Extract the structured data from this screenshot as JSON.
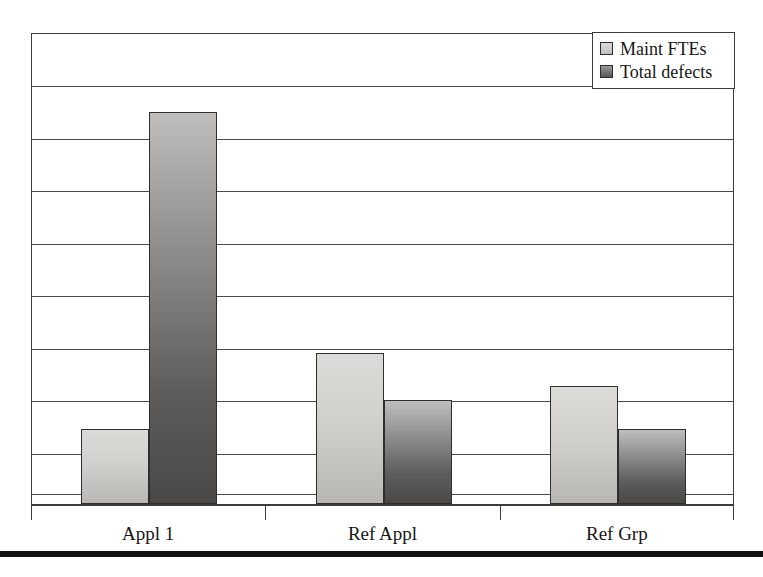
{
  "chart_data": {
    "type": "bar",
    "title": "",
    "subtitle": "",
    "xlabel": "",
    "ylabel": "",
    "categories": [
      "Appl 1",
      "Ref Appl",
      "Ref Grp"
    ],
    "series": [
      {
        "name": "Maint FTEs",
        "values": [
          1.6,
          3.2,
          2.5
        ],
        "color": "#d2d0cd"
      },
      {
        "name": "Total defects",
        "values": [
          8.3,
          2.2,
          1.6
        ],
        "color": "#5d5c5a"
      }
    ],
    "ylim": [
      0,
      10
    ],
    "y_gridline_count": 9,
    "y_tick_labels": [],
    "grid": true,
    "legend_position": "top-right",
    "annotations": []
  },
  "legend": {
    "entries": [
      {
        "label": "Maint FTEs",
        "swatch": "light-gray-square-icon"
      },
      {
        "label": "Total defects",
        "swatch": "dark-gray-square-icon"
      }
    ]
  },
  "axis": {
    "categories": [
      "Appl 1",
      "Ref Appl",
      "Ref Grp"
    ]
  },
  "colors": {
    "series_1_fill": "#d2d0cd",
    "series_2_fill": "#5d5c5a",
    "frame": "#3c3c3c",
    "gridline": "#4a4a4a",
    "rule": "#111111",
    "background": "#ffffff"
  }
}
